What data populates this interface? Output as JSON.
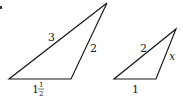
{
  "figure": {
    "marker": "•",
    "stroke_color": "#1a1a1a",
    "text_color": "#222222",
    "triangles": [
      {
        "id": "large",
        "vertices": [
          [
            9,
            79
          ],
          [
            71,
            79
          ],
          [
            107,
            3
          ]
        ],
        "side_labels": {
          "left_side": "3",
          "right_side": "2",
          "base_whole": "1",
          "base_frac_num": "1",
          "base_frac_den": "2"
        }
      },
      {
        "id": "small",
        "vertices": [
          [
            114,
            79
          ],
          [
            156,
            79
          ],
          [
            176,
            29
          ]
        ],
        "side_labels": {
          "left_side": "2",
          "right_side": "x",
          "base": "1"
        }
      }
    ]
  }
}
